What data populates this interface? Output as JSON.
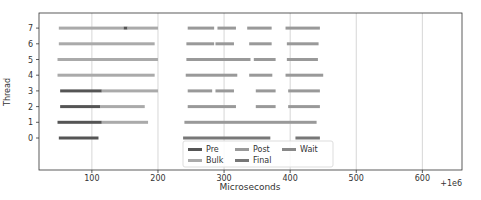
{
  "chart_data": {
    "type": "bar",
    "subtype": "horizontal-gantt",
    "title": "",
    "xlabel": "Microseconds",
    "ylabel": "Thread",
    "x_offset_label": "+1e6",
    "xlim": [
      20,
      660
    ],
    "xticks": [
      100,
      200,
      300,
      400,
      500,
      600
    ],
    "yticks": [
      0,
      1,
      2,
      3,
      4,
      5,
      6,
      7
    ],
    "grid": "vertical",
    "legend": {
      "position": "lower center",
      "entries": [
        {
          "name": "Pre",
          "color": "#555555"
        },
        {
          "name": "Bulk",
          "color": "#aaaaaa"
        },
        {
          "name": "Post",
          "color": "#999999"
        },
        {
          "name": "Final",
          "color": "#777777"
        },
        {
          "name": "Wait",
          "color": "#888888"
        }
      ]
    },
    "series": [
      {
        "thread": 7,
        "segments": [
          {
            "phase": "Bulk",
            "start": 50,
            "end": 148
          },
          {
            "phase": "Pre",
            "start": 148,
            "end": 154
          },
          {
            "phase": "Bulk",
            "start": 154,
            "end": 200
          },
          {
            "phase": "Post",
            "start": 245,
            "end": 285
          },
          {
            "phase": "Post",
            "start": 290,
            "end": 318
          },
          {
            "phase": "Post",
            "start": 335,
            "end": 372
          },
          {
            "phase": "Post",
            "start": 393,
            "end": 445
          }
        ]
      },
      {
        "thread": 6,
        "segments": [
          {
            "phase": "Bulk",
            "start": 50,
            "end": 195
          },
          {
            "phase": "Post",
            "start": 243,
            "end": 285
          },
          {
            "phase": "Post",
            "start": 287,
            "end": 315
          },
          {
            "phase": "Post",
            "start": 338,
            "end": 372
          },
          {
            "phase": "Post",
            "start": 395,
            "end": 443
          }
        ]
      },
      {
        "thread": 5,
        "segments": [
          {
            "phase": "Bulk",
            "start": 48,
            "end": 200
          },
          {
            "phase": "Post",
            "start": 243,
            "end": 340
          },
          {
            "phase": "Post",
            "start": 345,
            "end": 378
          },
          {
            "phase": "Post",
            "start": 395,
            "end": 442
          }
        ]
      },
      {
        "thread": 4,
        "segments": [
          {
            "phase": "Bulk",
            "start": 48,
            "end": 195
          },
          {
            "phase": "Post",
            "start": 242,
            "end": 320
          },
          {
            "phase": "Post",
            "start": 338,
            "end": 373
          },
          {
            "phase": "Post",
            "start": 393,
            "end": 450
          }
        ]
      },
      {
        "thread": 3,
        "segments": [
          {
            "phase": "Pre",
            "start": 52,
            "end": 115
          },
          {
            "phase": "Bulk",
            "start": 115,
            "end": 200
          },
          {
            "phase": "Post",
            "start": 245,
            "end": 282
          },
          {
            "phase": "Post",
            "start": 287,
            "end": 315
          },
          {
            "phase": "Post",
            "start": 348,
            "end": 378
          },
          {
            "phase": "Post",
            "start": 397,
            "end": 445
          }
        ]
      },
      {
        "thread": 2,
        "segments": [
          {
            "phase": "Pre",
            "start": 52,
            "end": 113
          },
          {
            "phase": "Bulk",
            "start": 113,
            "end": 180
          },
          {
            "phase": "Post",
            "start": 245,
            "end": 318
          },
          {
            "phase": "Post",
            "start": 348,
            "end": 378
          },
          {
            "phase": "Post",
            "start": 397,
            "end": 445
          }
        ]
      },
      {
        "thread": 1,
        "segments": [
          {
            "phase": "Pre",
            "start": 48,
            "end": 115
          },
          {
            "phase": "Bulk",
            "start": 115,
            "end": 185
          },
          {
            "phase": "Post",
            "start": 240,
            "end": 440
          }
        ]
      },
      {
        "thread": 0,
        "segments": [
          {
            "phase": "Pre",
            "start": 50,
            "end": 110
          },
          {
            "phase": "Final",
            "start": 238,
            "end": 370
          },
          {
            "phase": "Final",
            "start": 408,
            "end": 445
          }
        ]
      }
    ]
  }
}
